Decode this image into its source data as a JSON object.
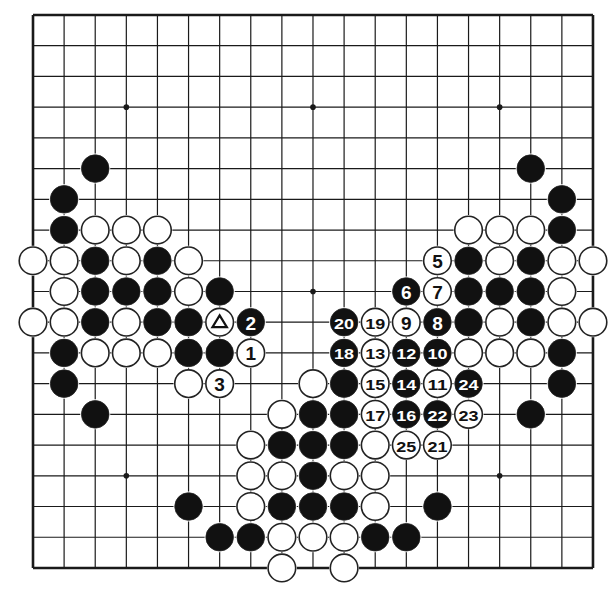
{
  "diagram": {
    "type": "go-board",
    "size": 19,
    "grid": {
      "left": 33,
      "top": 15,
      "dx": 31.11,
      "dy": 30.72
    },
    "colors": {
      "line": "#1a1a1a",
      "black_stone": "#111111",
      "white_stone": "#ffffff",
      "background": "#ffffff"
    },
    "star_points": [
      [
        3,
        3
      ],
      [
        9,
        3
      ],
      [
        15,
        3
      ],
      [
        3,
        9
      ],
      [
        9,
        9
      ],
      [
        15,
        9
      ],
      [
        3,
        15
      ],
      [
        9,
        15
      ],
      [
        15,
        15
      ]
    ],
    "stones": [
      {
        "c": 2,
        "r": 5,
        "color": "B"
      },
      {
        "c": 1,
        "r": 6,
        "color": "B"
      },
      {
        "c": 1,
        "r": 7,
        "color": "B"
      },
      {
        "c": 2,
        "r": 7,
        "color": "W"
      },
      {
        "c": 3,
        "r": 7,
        "color": "W"
      },
      {
        "c": 4,
        "r": 7,
        "color": "W"
      },
      {
        "c": 0,
        "r": 8,
        "color": "W"
      },
      {
        "c": 1,
        "r": 8,
        "color": "W"
      },
      {
        "c": 2,
        "r": 8,
        "color": "B"
      },
      {
        "c": 3,
        "r": 8,
        "color": "W"
      },
      {
        "c": 4,
        "r": 8,
        "color": "B"
      },
      {
        "c": 5,
        "r": 8,
        "color": "W"
      },
      {
        "c": 1,
        "r": 9,
        "color": "W"
      },
      {
        "c": 2,
        "r": 9,
        "color": "B"
      },
      {
        "c": 3,
        "r": 9,
        "color": "B"
      },
      {
        "c": 4,
        "r": 9,
        "color": "B"
      },
      {
        "c": 5,
        "r": 9,
        "color": "W"
      },
      {
        "c": 6,
        "r": 9,
        "color": "B"
      },
      {
        "c": 0,
        "r": 10,
        "color": "W"
      },
      {
        "c": 1,
        "r": 10,
        "color": "W"
      },
      {
        "c": 2,
        "r": 10,
        "color": "B"
      },
      {
        "c": 3,
        "r": 10,
        "color": "W"
      },
      {
        "c": 4,
        "r": 10,
        "color": "B"
      },
      {
        "c": 5,
        "r": 10,
        "color": "B"
      },
      {
        "c": 6,
        "r": 10,
        "color": "W",
        "mark": "triangle"
      },
      {
        "c": 7,
        "r": 10,
        "color": "B",
        "label": "2"
      },
      {
        "c": 1,
        "r": 11,
        "color": "B"
      },
      {
        "c": 2,
        "r": 11,
        "color": "W"
      },
      {
        "c": 3,
        "r": 11,
        "color": "W"
      },
      {
        "c": 4,
        "r": 11,
        "color": "W"
      },
      {
        "c": 5,
        "r": 11,
        "color": "B"
      },
      {
        "c": 6,
        "r": 11,
        "color": "B"
      },
      {
        "c": 7,
        "r": 11,
        "color": "W",
        "label": "1"
      },
      {
        "c": 1,
        "r": 12,
        "color": "B"
      },
      {
        "c": 5,
        "r": 12,
        "color": "W"
      },
      {
        "c": 6,
        "r": 12,
        "color": "W",
        "label": "3"
      },
      {
        "c": 2,
        "r": 13,
        "color": "B"
      },
      {
        "c": 16,
        "r": 5,
        "color": "B"
      },
      {
        "c": 17,
        "r": 6,
        "color": "B"
      },
      {
        "c": 14,
        "r": 7,
        "color": "W"
      },
      {
        "c": 15,
        "r": 7,
        "color": "W"
      },
      {
        "c": 16,
        "r": 7,
        "color": "W"
      },
      {
        "c": 17,
        "r": 7,
        "color": "B"
      },
      {
        "c": 13,
        "r": 8,
        "color": "W",
        "label": "5"
      },
      {
        "c": 14,
        "r": 8,
        "color": "B"
      },
      {
        "c": 15,
        "r": 8,
        "color": "W"
      },
      {
        "c": 16,
        "r": 8,
        "color": "B"
      },
      {
        "c": 17,
        "r": 8,
        "color": "W"
      },
      {
        "c": 18,
        "r": 8,
        "color": "W"
      },
      {
        "c": 12,
        "r": 9,
        "color": "B",
        "label": "6"
      },
      {
        "c": 13,
        "r": 9,
        "color": "W",
        "label": "7"
      },
      {
        "c": 14,
        "r": 9,
        "color": "B"
      },
      {
        "c": 15,
        "r": 9,
        "color": "B"
      },
      {
        "c": 16,
        "r": 9,
        "color": "B"
      },
      {
        "c": 17,
        "r": 9,
        "color": "W"
      },
      {
        "c": 10,
        "r": 10,
        "color": "B",
        "label": "20"
      },
      {
        "c": 11,
        "r": 10,
        "color": "W",
        "label": "19"
      },
      {
        "c": 12,
        "r": 10,
        "color": "W",
        "label": "9"
      },
      {
        "c": 13,
        "r": 10,
        "color": "B",
        "label": "8"
      },
      {
        "c": 14,
        "r": 10,
        "color": "B"
      },
      {
        "c": 15,
        "r": 10,
        "color": "W"
      },
      {
        "c": 16,
        "r": 10,
        "color": "B"
      },
      {
        "c": 17,
        "r": 10,
        "color": "W"
      },
      {
        "c": 18,
        "r": 10,
        "color": "W"
      },
      {
        "c": 10,
        "r": 11,
        "color": "B",
        "label": "18"
      },
      {
        "c": 11,
        "r": 11,
        "color": "W",
        "label": "13"
      },
      {
        "c": 12,
        "r": 11,
        "color": "B",
        "label": "12"
      },
      {
        "c": 13,
        "r": 11,
        "color": "B",
        "label": "10"
      },
      {
        "c": 14,
        "r": 11,
        "color": "W"
      },
      {
        "c": 15,
        "r": 11,
        "color": "W"
      },
      {
        "c": 16,
        "r": 11,
        "color": "W"
      },
      {
        "c": 17,
        "r": 11,
        "color": "B"
      },
      {
        "c": 9,
        "r": 12,
        "color": "W"
      },
      {
        "c": 10,
        "r": 12,
        "color": "B"
      },
      {
        "c": 11,
        "r": 12,
        "color": "W",
        "label": "15"
      },
      {
        "c": 12,
        "r": 12,
        "color": "B",
        "label": "14"
      },
      {
        "c": 13,
        "r": 12,
        "color": "W",
        "label": "11"
      },
      {
        "c": 14,
        "r": 12,
        "color": "B",
        "label": "24"
      },
      {
        "c": 17,
        "r": 12,
        "color": "B"
      },
      {
        "c": 8,
        "r": 13,
        "color": "W"
      },
      {
        "c": 9,
        "r": 13,
        "color": "B"
      },
      {
        "c": 10,
        "r": 13,
        "color": "B"
      },
      {
        "c": 11,
        "r": 13,
        "color": "W",
        "label": "17"
      },
      {
        "c": 12,
        "r": 13,
        "color": "B",
        "label": "16"
      },
      {
        "c": 13,
        "r": 13,
        "color": "B",
        "label": "22"
      },
      {
        "c": 14,
        "r": 13,
        "color": "W",
        "label": "23"
      },
      {
        "c": 16,
        "r": 13,
        "color": "B"
      },
      {
        "c": 7,
        "r": 14,
        "color": "W"
      },
      {
        "c": 8,
        "r": 14,
        "color": "B"
      },
      {
        "c": 9,
        "r": 14,
        "color": "B"
      },
      {
        "c": 10,
        "r": 14,
        "color": "B"
      },
      {
        "c": 11,
        "r": 14,
        "color": "W"
      },
      {
        "c": 12,
        "r": 14,
        "color": "W",
        "label": "25"
      },
      {
        "c": 13,
        "r": 14,
        "color": "W",
        "label": "21"
      },
      {
        "c": 7,
        "r": 15,
        "color": "W"
      },
      {
        "c": 8,
        "r": 15,
        "color": "W"
      },
      {
        "c": 9,
        "r": 15,
        "color": "B"
      },
      {
        "c": 10,
        "r": 15,
        "color": "W"
      },
      {
        "c": 11,
        "r": 15,
        "color": "W"
      },
      {
        "c": 5,
        "r": 16,
        "color": "B"
      },
      {
        "c": 7,
        "r": 16,
        "color": "W"
      },
      {
        "c": 8,
        "r": 16,
        "color": "B"
      },
      {
        "c": 9,
        "r": 16,
        "color": "B"
      },
      {
        "c": 10,
        "r": 16,
        "color": "B"
      },
      {
        "c": 11,
        "r": 16,
        "color": "W"
      },
      {
        "c": 13,
        "r": 16,
        "color": "B"
      },
      {
        "c": 6,
        "r": 17,
        "color": "B"
      },
      {
        "c": 7,
        "r": 17,
        "color": "B"
      },
      {
        "c": 8,
        "r": 17,
        "color": "W"
      },
      {
        "c": 9,
        "r": 17,
        "color": "W"
      },
      {
        "c": 10,
        "r": 17,
        "color": "W"
      },
      {
        "c": 11,
        "r": 17,
        "color": "B"
      },
      {
        "c": 12,
        "r": 17,
        "color": "B"
      },
      {
        "c": 8,
        "r": 18,
        "color": "W"
      },
      {
        "c": 10,
        "r": 18,
        "color": "W"
      }
    ]
  }
}
